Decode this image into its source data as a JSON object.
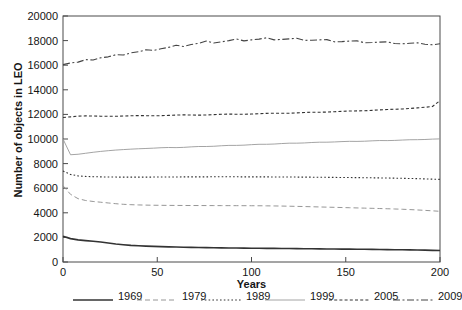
{
  "chart_data": {
    "type": "line",
    "title": "",
    "xlabel": "Years",
    "ylabel": "Number of objects in LEO",
    "xlim": [
      0,
      200
    ],
    "ylim": [
      0,
      20000
    ],
    "xticks": [
      0,
      50,
      100,
      150,
      200
    ],
    "yticks": [
      0,
      2000,
      4000,
      6000,
      8000,
      10000,
      12000,
      14000,
      16000,
      18000,
      20000
    ],
    "grid": false,
    "legend_position": "bottom",
    "x": [
      0,
      4,
      8,
      12,
      16,
      20,
      24,
      28,
      32,
      36,
      40,
      44,
      48,
      52,
      56,
      60,
      64,
      68,
      72,
      76,
      80,
      84,
      88,
      92,
      96,
      100,
      104,
      108,
      112,
      116,
      120,
      124,
      128,
      132,
      136,
      140,
      144,
      148,
      152,
      156,
      160,
      164,
      168,
      172,
      176,
      180,
      184,
      188,
      192,
      196,
      200
    ],
    "series": [
      {
        "name": "1969",
        "style": "solid-thick",
        "color": "#333333",
        "values": [
          2100,
          1900,
          1800,
          1740,
          1690,
          1620,
          1540,
          1460,
          1400,
          1350,
          1320,
          1290,
          1270,
          1250,
          1230,
          1215,
          1200,
          1190,
          1180,
          1170,
          1160,
          1150,
          1142,
          1135,
          1128,
          1122,
          1116,
          1110,
          1104,
          1098,
          1092,
          1086,
          1080,
          1074,
          1068,
          1062,
          1056,
          1050,
          1044,
          1038,
          1032,
          1025,
          1018,
          1010,
          1002,
          995,
          985,
          975,
          962,
          948,
          935
        ]
      },
      {
        "name": "1979",
        "style": "dashed-light",
        "color": "#8a8a8a",
        "values": [
          6200,
          5500,
          5150,
          5000,
          4920,
          4860,
          4800,
          4740,
          4690,
          4660,
          4640,
          4625,
          4615,
          4608,
          4602,
          4598,
          4595,
          4592,
          4590,
          4588,
          4586,
          4584,
          4582,
          4580,
          4578,
          4576,
          4572,
          4566,
          4558,
          4548,
          4536,
          4522,
          4508,
          4492,
          4476,
          4460,
          4444,
          4428,
          4412,
          4396,
          4380,
          4364,
          4348,
          4330,
          4310,
          4288,
          4262,
          4232,
          4198,
          4160,
          4120
        ]
      },
      {
        "name": "1989",
        "style": "dotted",
        "color": "#333333",
        "values": [
          7400,
          7120,
          7000,
          6960,
          6935,
          6920,
          6910,
          6905,
          6902,
          6900,
          6900,
          6902,
          6905,
          6908,
          6912,
          6915,
          6918,
          6920,
          6922,
          6924,
          6925,
          6926,
          6926,
          6925,
          6924,
          6922,
          6920,
          6918,
          6915,
          6912,
          6908,
          6904,
          6900,
          6896,
          6890,
          6884,
          6878,
          6872,
          6866,
          6860,
          6852,
          6844,
          6836,
          6826,
          6816,
          6804,
          6790,
          6774,
          6756,
          6736,
          6714
        ]
      },
      {
        "name": "1999",
        "style": "solid-light",
        "color": "#9a9a9a",
        "values": [
          10000,
          8720,
          8760,
          8840,
          8920,
          8990,
          9050,
          9100,
          9140,
          9175,
          9205,
          9230,
          9255,
          9290,
          9310,
          9300,
          9320,
          9360,
          9390,
          9390,
          9410,
          9450,
          9480,
          9480,
          9500,
          9540,
          9570,
          9570,
          9590,
          9630,
          9660,
          9660,
          9680,
          9715,
          9740,
          9740,
          9760,
          9790,
          9810,
          9805,
          9820,
          9850,
          9875,
          9870,
          9885,
          9915,
          9940,
          9945,
          9960,
          9990,
          10010
        ]
      },
      {
        "name": "2005",
        "style": "dash-dot-short",
        "color": "#333333",
        "values": [
          11750,
          11800,
          11860,
          11880,
          11870,
          11855,
          11845,
          11850,
          11870,
          11890,
          11900,
          11895,
          11885,
          11895,
          11920,
          11945,
          11960,
          11950,
          11940,
          11955,
          11985,
          12010,
          12025,
          12015,
          12010,
          12030,
          12060,
          12085,
          12095,
          12090,
          12095,
          12125,
          12155,
          12175,
          12180,
          12185,
          12215,
          12250,
          12275,
          12285,
          12295,
          12330,
          12370,
          12400,
          12420,
          12440,
          12480,
          12530,
          12580,
          12640,
          13120
        ]
      },
      {
        "name": "2009",
        "style": "dash-dot-long",
        "color": "#444444",
        "values": [
          16050,
          16180,
          16250,
          16450,
          16420,
          16600,
          16680,
          16850,
          16830,
          17000,
          17090,
          17250,
          17200,
          17340,
          17450,
          17620,
          17520,
          17680,
          17780,
          17960,
          17800,
          17900,
          18000,
          18130,
          17980,
          18060,
          18120,
          18230,
          18060,
          18100,
          18140,
          18190,
          18020,
          18030,
          18060,
          18080,
          17900,
          17920,
          17960,
          17980,
          17820,
          17840,
          17880,
          17900,
          17760,
          17740,
          17780,
          17820,
          17700,
          17660,
          17740
        ]
      }
    ]
  },
  "legend": {
    "items": [
      {
        "label": "1969"
      },
      {
        "label": "1979"
      },
      {
        "label": "1989"
      },
      {
        "label": "1999"
      },
      {
        "label": "2005"
      },
      {
        "label": "2009"
      }
    ]
  }
}
